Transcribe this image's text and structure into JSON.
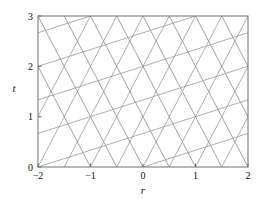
{
  "figure": {
    "name": "characteristics-lattice-plot",
    "background_color": "#ffffff"
  },
  "chart_data": {
    "type": "line",
    "title": "",
    "xlabel": "r",
    "ylabel": "t",
    "xlim": [
      -2,
      2
    ],
    "ylim": [
      0,
      3
    ],
    "xticks": [
      -2,
      -1,
      0,
      1,
      2
    ],
    "xtick_labels": [
      "−2",
      "−1",
      "0",
      "1",
      "2"
    ],
    "yticks": [
      0,
      1,
      2,
      3
    ],
    "ytick_labels": [
      "0",
      "1",
      "2",
      "3"
    ],
    "grid": false,
    "legend": null,
    "frame": "box",
    "line_color": "#8c8c8c",
    "line_width": 0.8,
    "axis_color": "#6e6e6e",
    "series": [
      {
        "name": "steep-positive-characteristics",
        "slope": 2,
        "style": "solid",
        "color": "#9a9a9a",
        "intercepts_r_at_t0": [
          -2.5,
          -2,
          -1.5,
          -1,
          -0.5,
          0,
          0.5,
          1,
          1.5,
          2
        ],
        "points": [
          [
            [
              -2.5,
              0
            ],
            [
              -1,
              3
            ]
          ],
          [
            [
              -2,
              0
            ],
            [
              -0.5,
              3
            ]
          ],
          [
            [
              -1.5,
              0
            ],
            [
              0,
              3
            ]
          ],
          [
            [
              -1,
              0
            ],
            [
              0.5,
              3
            ]
          ],
          [
            [
              -0.5,
              0
            ],
            [
              1,
              3
            ]
          ],
          [
            [
              0,
              0
            ],
            [
              1.5,
              3
            ]
          ],
          [
            [
              0.5,
              0
            ],
            [
              2,
              3
            ]
          ],
          [
            [
              1,
              0
            ],
            [
              2.5,
              3
            ]
          ],
          [
            [
              1.5,
              0
            ],
            [
              3,
              3
            ]
          ],
          [
            [
              2,
              0
            ],
            [
              3.5,
              3
            ]
          ]
        ]
      },
      {
        "name": "steep-negative-characteristics",
        "slope": -2,
        "style": "solid",
        "color": "#8a8a8a",
        "intercepts_r_at_t0": [
          -1,
          -0.5,
          0,
          0.5,
          1,
          1.5,
          2,
          2.5,
          3,
          3.5
        ],
        "points": [
          [
            [
              -1,
              0
            ],
            [
              -2.5,
              3
            ]
          ],
          [
            [
              -0.5,
              0
            ],
            [
              -2,
              3
            ]
          ],
          [
            [
              0,
              0
            ],
            [
              -1.5,
              3
            ]
          ],
          [
            [
              0.5,
              0
            ],
            [
              -1,
              3
            ]
          ],
          [
            [
              1,
              0
            ],
            [
              -0.5,
              3
            ]
          ],
          [
            [
              1.5,
              0
            ],
            [
              0,
              3
            ]
          ],
          [
            [
              2,
              0
            ],
            [
              0.5,
              3
            ]
          ],
          [
            [
              2.5,
              0
            ],
            [
              1,
              3
            ]
          ],
          [
            [
              3,
              0
            ],
            [
              1.5,
              3
            ]
          ],
          [
            [
              3.5,
              0
            ],
            [
              2,
              3
            ]
          ]
        ]
      },
      {
        "name": "shallow-positive-characteristics",
        "slope": 0.3333,
        "style": "solid",
        "color": "#9a9a9a",
        "t_intercepts_at_r_minus2": [
          -0.6667,
          0,
          0.6667,
          1.3333,
          2,
          2.6667,
          3.3333
        ],
        "points": [
          [
            [
              -2,
              -0.6667
            ],
            [
              2,
              0.6667
            ]
          ],
          [
            [
              -2,
              0
            ],
            [
              2,
              1.3333
            ]
          ],
          [
            [
              -2,
              0.6667
            ],
            [
              2,
              2
            ]
          ],
          [
            [
              -2,
              1.3333
            ],
            [
              2,
              2.6667
            ]
          ],
          [
            [
              -2,
              2
            ],
            [
              2,
              3.3333
            ]
          ],
          [
            [
              -2,
              2.6667
            ],
            [
              2,
              4
            ]
          ],
          [
            [
              -2,
              3.3333
            ],
            [
              2,
              4.6667
            ]
          ]
        ]
      }
    ]
  }
}
